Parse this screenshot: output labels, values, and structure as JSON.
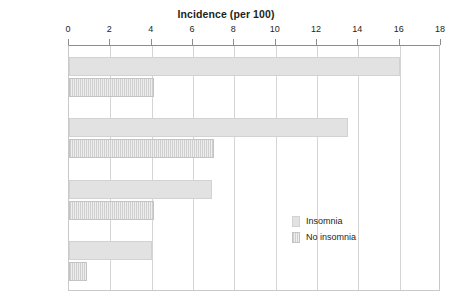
{
  "chart_data": {
    "type": "bar",
    "orientation": "horizontal",
    "title": "Incidence (per 100)",
    "xlabel": "",
    "ylabel": "",
    "xlim": [
      0,
      18
    ],
    "xticks": [
      0,
      2,
      4,
      6,
      8,
      10,
      12,
      14,
      16,
      18
    ],
    "xtick_labels": [
      "0",
      "2",
      "4",
      "6",
      "8",
      "10",
      "12",
      "14",
      "16",
      "18"
    ],
    "grid": true,
    "grid_axis": "x",
    "legend_position": "inside-right-lower",
    "categories": [
      "Depression",
      "Anxiety",
      "Alcohol abuse",
      "Drug abuse"
    ],
    "series": [
      {
        "name": "Insomnia",
        "color": "#e2e2e2",
        "values": [
          16.0,
          13.5,
          6.9,
          4.0
        ]
      },
      {
        "name": "No insomnia",
        "color": "#dcdcdc",
        "values": [
          4.1,
          7.0,
          4.1,
          0.85
        ]
      }
    ]
  },
  "legend": {
    "items": [
      {
        "label": "Insomnia"
      },
      {
        "label": "No insomnia"
      }
    ]
  },
  "colors": {
    "axis": "#8d8d8d",
    "grid": "#d5d5d5",
    "text": "#231f20",
    "background": "#ffffff"
  }
}
